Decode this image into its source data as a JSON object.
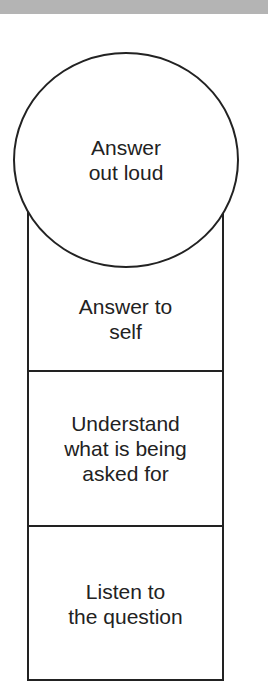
{
  "diagram": {
    "type": "stacked hierarchy with circle on top",
    "top_band_color": "#b4b4b4",
    "line_color": "#222222",
    "top": {
      "label": "Answer\nout loud",
      "shape": "circle"
    },
    "levels": [
      {
        "label": "Answer to\nself"
      },
      {
        "label": "Understand\nwhat is being\nasked for"
      },
      {
        "label": "Listen to\nthe question"
      }
    ]
  }
}
